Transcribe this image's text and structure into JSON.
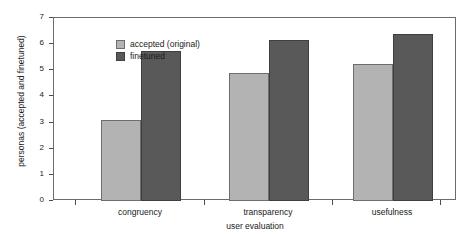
{
  "chart_data": {
    "type": "bar",
    "title": "",
    "xlabel": "user evaluation",
    "ylabel": "personas (accepted and finetuned)",
    "categories": [
      "congruency",
      "transparency",
      "usefulness"
    ],
    "series": [
      {
        "name": "accepted (original)",
        "values": [
          3.1,
          4.9,
          5.25
        ],
        "color": "#b3b3b3"
      },
      {
        "name": "finetuned",
        "values": [
          5.75,
          6.15,
          6.4
        ],
        "color": "#595959"
      }
    ],
    "ylim": [
      0,
      7
    ],
    "yticks": [
      0,
      1,
      2,
      3,
      4,
      5,
      6,
      7
    ],
    "ytick_labels": [
      "0",
      "1",
      "2",
      "3",
      "4",
      "5",
      "6",
      "7"
    ],
    "grid": false,
    "legend_position": "top-left"
  },
  "legend": {
    "items": [
      {
        "label": "accepted (original)"
      },
      {
        "label": "finetuned"
      }
    ]
  }
}
